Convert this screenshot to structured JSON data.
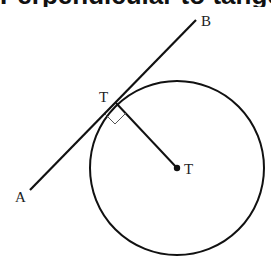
{
  "title": "Perpendicular to tangent",
  "diagram": {
    "labels": {
      "point_a": "A",
      "point_b": "B",
      "tangent_point": "T",
      "center": "T"
    },
    "colors": {
      "stroke": "#111111",
      "background": "#ffffff"
    },
    "geometry": {
      "circle_center": [
        177,
        168
      ],
      "circle_radius": 87,
      "tangent_point": [
        116,
        103
      ],
      "line_start_a": [
        30,
        190
      ],
      "line_end_b": [
        196,
        20
      ]
    }
  }
}
